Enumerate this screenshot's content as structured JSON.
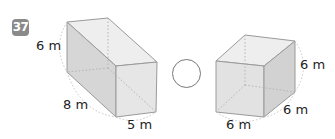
{
  "problem": {
    "number": "37",
    "badge_color": "#8a8a8a",
    "instruction_comparison_symbol": ""
  },
  "left_prism": {
    "height_label": "6 m",
    "length_label": "8 m",
    "width_label": "5 m"
  },
  "right_prism": {
    "height_label": "6 m",
    "depth_label": "6 m",
    "width_label": "6 m"
  },
  "colors": {
    "face_front": "#e4e4e4",
    "face_side": "#d2d2d2",
    "face_top": "#eeeeee",
    "edge": "#9a9a9a",
    "arc": "#bdbdbd"
  }
}
